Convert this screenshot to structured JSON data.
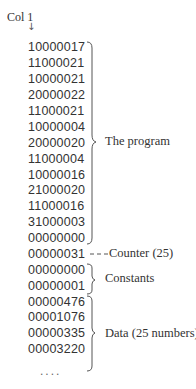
{
  "header": {
    "column_label": "Col 1",
    "arrow": "↓"
  },
  "rows": [
    "10000017",
    "11000021",
    "10000021",
    "20000022",
    "11000021",
    "10000004",
    "20000020",
    "11000004",
    "10000016",
    "21000020",
    "11000016",
    "31000003",
    "00000000",
    "00000031",
    "00000000",
    "00000001",
    "00000476",
    "00001076",
    "00000335",
    "00003220"
  ],
  "ellipsis": "....",
  "annotations": {
    "program": "The program",
    "counter": "Counter (25)",
    "constants": "Constants",
    "data": "Data (25 numbers)"
  }
}
